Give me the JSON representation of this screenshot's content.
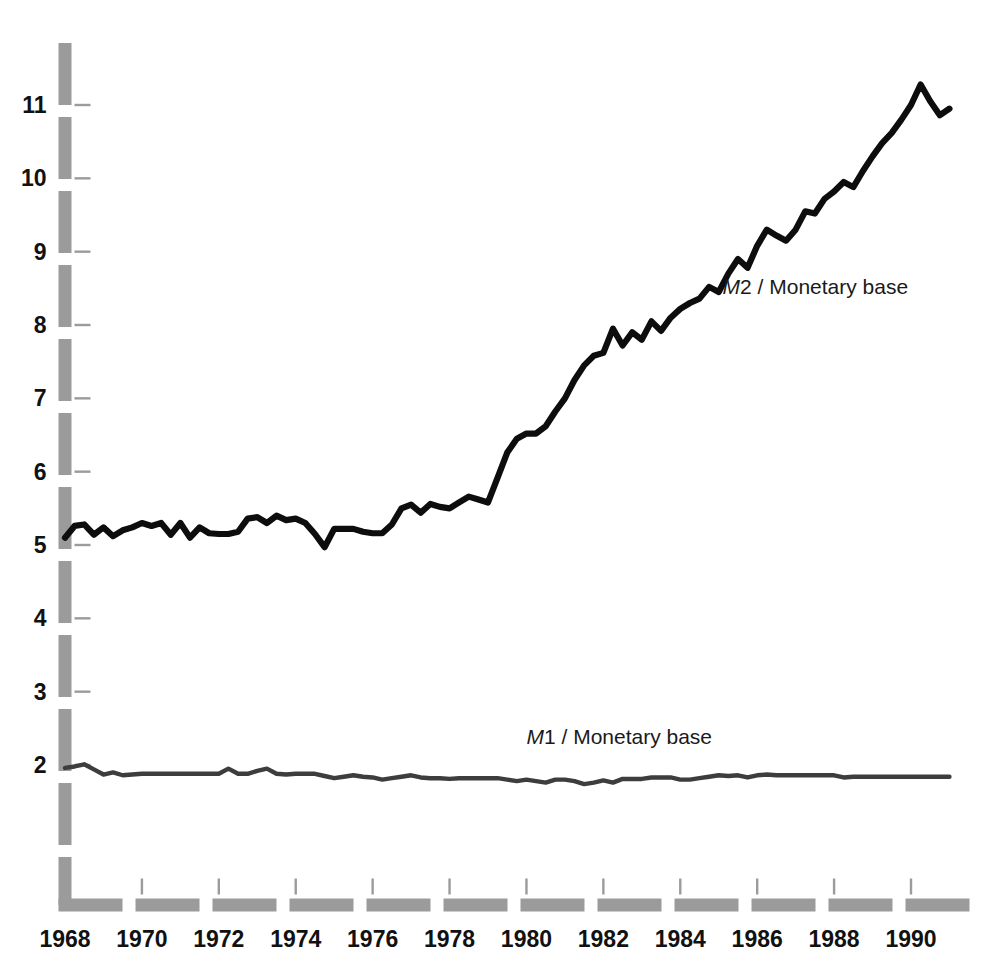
{
  "chart_data": {
    "type": "line",
    "title": "",
    "subtitle": "",
    "xlabel": "",
    "ylabel": "",
    "xlim": [
      1968,
      1991
    ],
    "ylim": [
      1.45,
      11.9
    ],
    "grid": false,
    "legend_position": "inline-annotation",
    "y_ticks": [
      2,
      3,
      4,
      5,
      6,
      7,
      8,
      9,
      10,
      11
    ],
    "y_tick_labels": [
      "2",
      "3",
      "4",
      "5",
      "6",
      "7",
      "8",
      "9",
      "10",
      "11"
    ],
    "x_ticks": [
      1968,
      1970,
      1972,
      1974,
      1976,
      1978,
      1980,
      1982,
      1984,
      1986,
      1988,
      1990
    ],
    "x_tick_labels": [
      "1968",
      "1970",
      "1972",
      "1974",
      "1976",
      "1978",
      "1980",
      "1982",
      "1984",
      "1986",
      "1988",
      "1990"
    ],
    "annotations": [
      {
        "name": "m2-series-label",
        "text_italic": "M",
        "text_rest": "2 / Monetary base",
        "x": 1985.1,
        "y": 8.42
      },
      {
        "name": "m1-series-label",
        "text_italic": "M",
        "text_rest": "1 / Monetary base",
        "x": 1980.0,
        "y": 2.28
      }
    ],
    "series": [
      {
        "name": "M2 / Monetary base",
        "color": "#0d0d0d",
        "x": [
          1968.0,
          1968.25,
          1968.5,
          1968.75,
          1969.0,
          1969.25,
          1969.5,
          1969.75,
          1970.0,
          1970.25,
          1970.5,
          1970.75,
          1971.0,
          1971.25,
          1971.5,
          1971.75,
          1972.0,
          1972.25,
          1972.5,
          1972.75,
          1973.0,
          1973.25,
          1973.5,
          1973.75,
          1974.0,
          1974.25,
          1974.5,
          1974.75,
          1975.0,
          1975.25,
          1975.5,
          1975.75,
          1976.0,
          1976.25,
          1976.5,
          1976.75,
          1977.0,
          1977.25,
          1977.5,
          1977.75,
          1978.0,
          1978.25,
          1978.5,
          1978.75,
          1979.0,
          1979.25,
          1979.5,
          1979.75,
          1980.0,
          1980.25,
          1980.5,
          1980.75,
          1981.0,
          1981.25,
          1981.5,
          1981.75,
          1982.0,
          1982.25,
          1982.5,
          1982.75,
          1983.0,
          1983.25,
          1983.5,
          1983.75,
          1984.0,
          1984.25,
          1984.5,
          1984.75,
          1985.0,
          1985.25,
          1985.5,
          1985.75,
          1986.0,
          1986.25,
          1986.5,
          1986.75,
          1987.0,
          1987.25,
          1987.5,
          1987.75,
          1988.0,
          1988.25,
          1988.5,
          1988.75,
          1989.0,
          1989.25,
          1989.5,
          1989.75,
          1990.0,
          1990.25,
          1990.5,
          1990.75,
          1991.0
        ],
        "y": [
          5.1,
          5.26,
          5.28,
          5.14,
          5.24,
          5.12,
          5.2,
          5.24,
          5.3,
          5.26,
          5.3,
          5.14,
          5.3,
          5.1,
          5.24,
          5.16,
          5.15,
          5.15,
          5.18,
          5.36,
          5.38,
          5.3,
          5.4,
          5.34,
          5.36,
          5.3,
          5.15,
          4.97,
          5.22,
          5.22,
          5.22,
          5.18,
          5.16,
          5.16,
          5.28,
          5.5,
          5.55,
          5.44,
          5.56,
          5.52,
          5.5,
          5.58,
          5.66,
          5.62,
          5.58,
          5.92,
          6.26,
          6.45,
          6.52,
          6.52,
          6.62,
          6.82,
          7.0,
          7.25,
          7.45,
          7.58,
          7.62,
          7.95,
          7.72,
          7.9,
          7.8,
          8.05,
          7.92,
          8.1,
          8.22,
          8.3,
          8.36,
          8.52,
          8.45,
          8.7,
          8.9,
          8.78,
          9.08,
          9.3,
          9.22,
          9.15,
          9.3,
          9.55,
          9.52,
          9.72,
          9.82,
          9.95,
          9.88,
          10.1,
          10.3,
          10.48,
          10.62,
          10.8,
          11.0,
          11.28,
          11.05,
          10.86,
          10.95
        ]
      },
      {
        "name": "M1 / Monetary base",
        "color": "#3d3d3d",
        "x": [
          1968.0,
          1968.25,
          1968.5,
          1968.75,
          1969.0,
          1969.25,
          1969.5,
          1969.75,
          1970.0,
          1970.25,
          1970.5,
          1970.75,
          1971.0,
          1971.25,
          1971.5,
          1971.75,
          1972.0,
          1972.25,
          1972.5,
          1972.75,
          1973.0,
          1973.25,
          1973.5,
          1973.75,
          1974.0,
          1974.25,
          1974.5,
          1974.75,
          1975.0,
          1975.25,
          1975.5,
          1975.75,
          1976.0,
          1976.25,
          1976.5,
          1976.75,
          1977.0,
          1977.25,
          1977.5,
          1977.75,
          1978.0,
          1978.25,
          1978.5,
          1978.75,
          1979.0,
          1979.25,
          1979.5,
          1979.75,
          1980.0,
          1980.25,
          1980.5,
          1980.75,
          1981.0,
          1981.25,
          1981.5,
          1981.75,
          1982.0,
          1982.25,
          1982.5,
          1982.75,
          1983.0,
          1983.25,
          1983.5,
          1983.75,
          1984.0,
          1984.25,
          1984.5,
          1984.75,
          1985.0,
          1985.25,
          1985.5,
          1985.75,
          1986.0,
          1986.25,
          1986.5,
          1986.75,
          1987.0,
          1987.25,
          1987.5,
          1987.75,
          1988.0,
          1988.25,
          1988.5,
          1988.75,
          1989.0,
          1989.25,
          1989.5,
          1989.75,
          1990.0,
          1990.25,
          1990.5,
          1990.75,
          1991.0
        ],
        "y": [
          1.96,
          1.98,
          2.01,
          1.94,
          1.87,
          1.9,
          1.86,
          1.87,
          1.88,
          1.88,
          1.88,
          1.88,
          1.88,
          1.88,
          1.88,
          1.88,
          1.88,
          1.95,
          1.88,
          1.88,
          1.92,
          1.95,
          1.88,
          1.87,
          1.88,
          1.88,
          1.88,
          1.85,
          1.82,
          1.84,
          1.86,
          1.84,
          1.83,
          1.8,
          1.82,
          1.84,
          1.86,
          1.83,
          1.82,
          1.82,
          1.81,
          1.82,
          1.82,
          1.82,
          1.82,
          1.82,
          1.8,
          1.78,
          1.8,
          1.78,
          1.76,
          1.8,
          1.8,
          1.78,
          1.74,
          1.76,
          1.79,
          1.76,
          1.81,
          1.81,
          1.81,
          1.83,
          1.83,
          1.83,
          1.8,
          1.8,
          1.82,
          1.84,
          1.86,
          1.85,
          1.86,
          1.83,
          1.86,
          1.87,
          1.86,
          1.86,
          1.86,
          1.86,
          1.86,
          1.86,
          1.86,
          1.83,
          1.84,
          1.84,
          1.84,
          1.84,
          1.84,
          1.84,
          1.84,
          1.84,
          1.84,
          1.84,
          1.84
        ]
      }
    ]
  },
  "axes": {
    "y_axis_name": "y-axis",
    "x_axis_name": "x-axis",
    "axis_color": "#9b9b9b",
    "tick_color": "#9b9b9b",
    "label_color": "#111111"
  }
}
